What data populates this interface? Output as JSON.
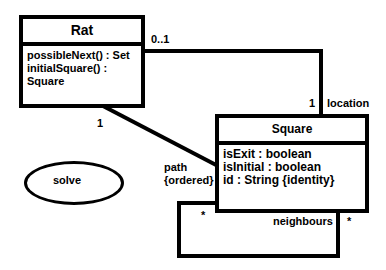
{
  "classes": {
    "rat": {
      "name": "Rat",
      "members": [
        "possibleNext() : Set",
        "initialSquare() : Square"
      ]
    },
    "square": {
      "name": "Square",
      "members": [
        "isExit : boolean",
        "isInitial : boolean",
        "id : String {identity}"
      ]
    }
  },
  "associations": {
    "location": {
      "rat_multiplicity": "0..1",
      "square_multiplicity": "1",
      "role": "location"
    },
    "path": {
      "rat_multiplicity": "1",
      "role": "path",
      "constraint": "{ordered}"
    },
    "neighbours": {
      "multiplicity_left": "*",
      "multiplicity_right": "*",
      "role": "neighbours"
    }
  },
  "usecase": {
    "label": "solve"
  }
}
